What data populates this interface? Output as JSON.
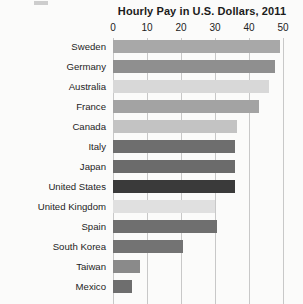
{
  "chart_data": {
    "type": "bar",
    "orientation": "horizontal",
    "title": "Hourly Pay in U.S. Dollars, 2011",
    "xlabel": "",
    "ylabel": "",
    "xlim": [
      0,
      50
    ],
    "xticks": [
      0,
      10,
      20,
      30,
      40,
      50
    ],
    "grid": true,
    "legend": "none",
    "categories": [
      "Sweden",
      "Germany",
      "Australia",
      "France",
      "Canada",
      "Italy",
      "Japan",
      "United States",
      "United Kingdom",
      "Spain",
      "South Korea",
      "Taiwan",
      "Mexico"
    ],
    "values": [
      49,
      47.5,
      46,
      43,
      36.5,
      36,
      36,
      36,
      30,
      30.5,
      20.5,
      8,
      5.5
    ],
    "bar_colors": [
      "#a8a8a8",
      "#8f8f8f",
      "#d8d8d8",
      "#a3a3a3",
      "#c3c3c3",
      "#6e6e6e",
      "#6b6b6b",
      "#3a3a3a",
      "#e0e0e0",
      "#6f6f6f",
      "#737373",
      "#8a8a8a",
      "#6e6e6e"
    ]
  },
  "axis": {
    "tick_labels": [
      "0",
      "10",
      "20",
      "30",
      "40",
      "50"
    ]
  }
}
